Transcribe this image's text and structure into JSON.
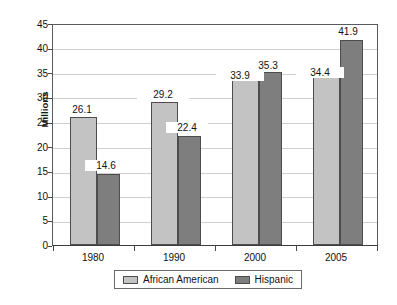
{
  "chart_data": {
    "type": "bar",
    "title": "",
    "subtitle": "",
    "xlabel": "",
    "ylabel": "Millions",
    "categories": [
      "1980",
      "1990",
      "2000",
      "2005"
    ],
    "series": [
      {
        "name": "African American",
        "color": "#c3c3c3",
        "values": [
          26.1,
          29.2,
          33.9,
          34.4
        ],
        "labels": [
          "26.1",
          "29.2",
          "33.9",
          "34.4"
        ]
      },
      {
        "name": "Hispanic",
        "color": "#7e7e7e",
        "values": [
          14.6,
          22.4,
          35.3,
          41.9
        ],
        "labels": [
          "14.6",
          "22.4",
          "35.3",
          "41.9"
        ]
      }
    ],
    "ylim": [
      0,
      45
    ],
    "ytick_step": 5,
    "yticks": [
      "45",
      "40",
      "35",
      "30",
      "25",
      "20",
      "15",
      "10",
      "5",
      "0"
    ],
    "grid": true,
    "grid_axis": "y",
    "legend_position": "bottom",
    "legend_entries": [
      "African American",
      "Hispanic"
    ]
  }
}
